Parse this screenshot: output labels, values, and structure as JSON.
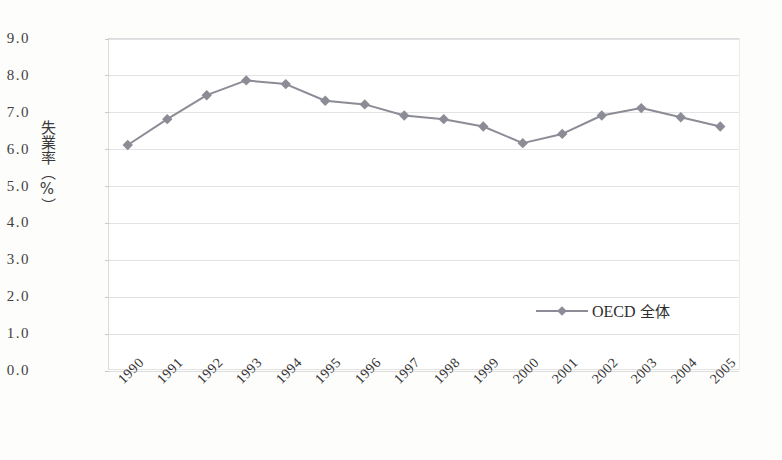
{
  "chart_data": {
    "type": "line",
    "title": "",
    "xlabel": "",
    "ylabel": "失業率（%）",
    "ylim": [
      0.0,
      9.0
    ],
    "ystep": 1.0,
    "grid": true,
    "legend_position": "inside-right",
    "categories": [
      "1990",
      "1991",
      "1992",
      "1993",
      "1994",
      "1995",
      "1996",
      "1997",
      "1998",
      "1999",
      "2000",
      "2001",
      "2002",
      "2003",
      "2004",
      "2005"
    ],
    "ytick_labels": [
      "9.0",
      "8.0",
      "7.0",
      "6.0",
      "5.0",
      "4.0",
      "3.0",
      "2.0",
      "1.0",
      "0.0"
    ],
    "ytick_values": [
      9.0,
      8.0,
      7.0,
      6.0,
      5.0,
      4.0,
      3.0,
      2.0,
      1.0,
      0.0
    ],
    "series": [
      {
        "name": "OECD 全体",
        "color": "#8c8c96",
        "marker": "diamond",
        "values": [
          6.1,
          6.8,
          7.45,
          7.85,
          7.75,
          7.3,
          7.2,
          6.9,
          6.8,
          6.6,
          6.15,
          6.4,
          6.9,
          7.1,
          6.85,
          6.6
        ]
      }
    ],
    "legend": [
      {
        "label_latin": "OECD",
        "label_cjk": "全体",
        "color": "#8c8c96"
      }
    ]
  },
  "axis": {
    "y_title": "失業率（%）"
  }
}
